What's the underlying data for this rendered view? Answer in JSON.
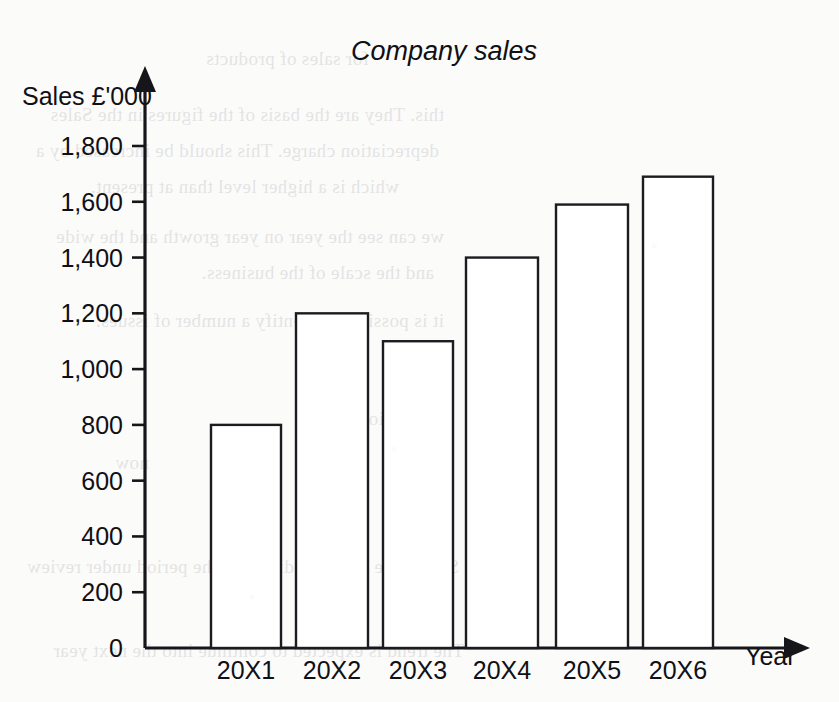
{
  "page": {
    "background_color": "#fbfbfa",
    "ink_color": "#16161a"
  },
  "chart_data": {
    "type": "bar",
    "title": "Company sales",
    "xlabel": "Year",
    "ylabel": "Sales £'000",
    "categories": [
      "20X1",
      "20X2",
      "20X3",
      "20X4",
      "20X5",
      "20X6"
    ],
    "values": [
      800,
      1200,
      1100,
      1400,
      1590,
      1690
    ],
    "ytick_labels": [
      "0",
      "200",
      "400",
      "600",
      "800",
      "1,000",
      "1,200",
      "1,400",
      "1,600",
      "1,800"
    ],
    "ytick_values": [
      0,
      200,
      400,
      600,
      800,
      1000,
      1200,
      1400,
      1600,
      1800
    ],
    "ylim": [
      0,
      1800
    ],
    "grid": false,
    "legend": null,
    "bar_fill": "#ffffff",
    "bar_stroke": "#1b1b20",
    "axis_arrows": true
  },
  "bleed_through": [
    {
      "x": 470,
      "y": 48,
      "text": "for sales of products"
    },
    {
      "x": 395,
      "y": 104,
      "text": "this. They are the basis of the figures in the Sales"
    },
    {
      "x": 400,
      "y": 140,
      "text": "depreciation charge. This should be increased by a"
    },
    {
      "x": 440,
      "y": 176,
      "text": "which is a higher level than at present."
    },
    {
      "x": 395,
      "y": 226,
      "text": "we can see the year on year growth and the wide"
    },
    {
      "x": 405,
      "y": 262,
      "text": "and the scale of the business."
    },
    {
      "x": 395,
      "y": 310,
      "text": "it is possible to identify a number of issues:"
    },
    {
      "x": 390,
      "y": 408,
      "text": "Conclusions"
    },
    {
      "x": 690,
      "y": 452,
      "text": "now"
    },
    {
      "x": 380,
      "y": 556,
      "text": "Sales have risen steadily over the period under review"
    },
    {
      "x": 375,
      "y": 640,
      "text": "The trend is expected to continue into the next year"
    }
  ]
}
